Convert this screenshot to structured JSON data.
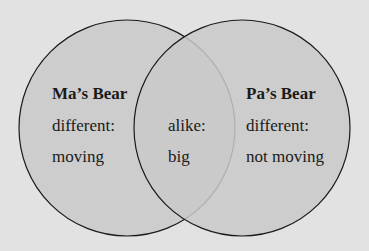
{
  "diagram": {
    "type": "venn",
    "colors": {
      "background": "#e2e2e2",
      "circle_fill": "#c8c8c8",
      "stroke": "#1a1a1a"
    },
    "left": {
      "title": "Ma’s Bear",
      "line1": "different:",
      "line2": "moving"
    },
    "overlap": {
      "line1": "alike:",
      "line2": "big"
    },
    "right": {
      "title": "Pa’s Bear",
      "line1": "different:",
      "line2": "not moving"
    }
  }
}
